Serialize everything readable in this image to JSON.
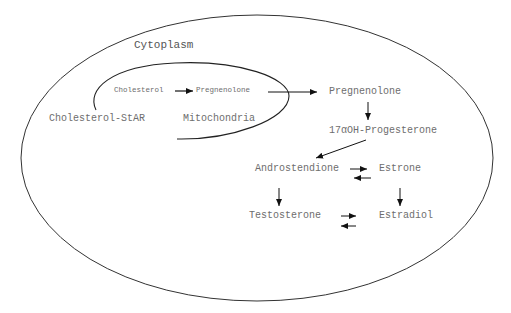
{
  "diagram": {
    "compartments": {
      "cytoplasm": "Cytoplasm",
      "mitochondria": "Mitochondria"
    },
    "labels": {
      "cholesterol_star": "Cholesterol-StAR",
      "mito_cholesterol": "Cholesterol",
      "mito_pregnenolone": "Pregnenolone",
      "pregnenolone": "Pregnenolone",
      "hydroxyprogesterone": "17αOH-Progesterone",
      "androstendione": "Androstendione",
      "estrone": "Estrone",
      "testosterone": "Testosterone",
      "estradiol": "Estradiol"
    },
    "edges": [
      {
        "from": "Cholesterol",
        "to": "Pregnenolone",
        "type": "forward",
        "location": "mitochondria"
      },
      {
        "from": "Pregnenolone (mitochondria)",
        "to": "Pregnenolone (cytoplasm)",
        "type": "forward"
      },
      {
        "from": "Pregnenolone",
        "to": "17αOH-Progesterone",
        "type": "forward"
      },
      {
        "from": "17αOH-Progesterone",
        "to": "Androstendione",
        "type": "forward"
      },
      {
        "from": "Androstendione",
        "to": "Estrone",
        "type": "reversible"
      },
      {
        "from": "Androstendione",
        "to": "Testosterone",
        "type": "forward"
      },
      {
        "from": "Estrone",
        "to": "Estradiol",
        "type": "forward"
      },
      {
        "from": "Testosterone",
        "to": "Estradiol",
        "type": "reversible"
      }
    ],
    "colors": {
      "line": "#222222",
      "text": "#6e6e6e"
    }
  }
}
